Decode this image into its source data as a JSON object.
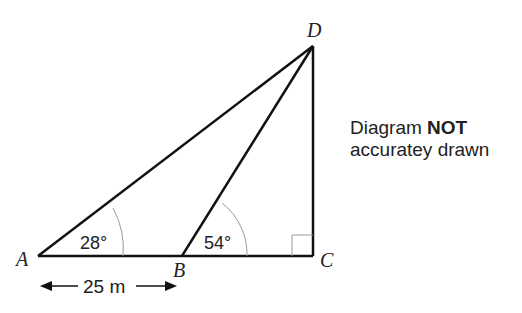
{
  "diagram": {
    "points": {
      "A": {
        "label": "A",
        "x": 38,
        "y": 256
      },
      "B": {
        "label": "B",
        "x": 182,
        "y": 256
      },
      "C": {
        "label": "C",
        "x": 313,
        "y": 256
      },
      "D": {
        "label": "D",
        "x": 313,
        "y": 46
      }
    },
    "angles": {
      "A": "28°",
      "B": "54°"
    },
    "measurement": {
      "AB": "25 m"
    },
    "note": {
      "line1_prefix": "Diagram ",
      "line1_bold": "NOT",
      "line2": "accuratey drawn"
    },
    "colors": {
      "line": "#111111",
      "arc": "#999999",
      "text": "#222222"
    }
  }
}
